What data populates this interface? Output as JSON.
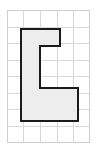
{
  "figure": {
    "canvas": {
      "width": 97,
      "height": 151,
      "background": "#ffffff"
    },
    "grid": {
      "name": "graph-paper-grid",
      "x_start": 7,
      "y_start": 10,
      "cell_size": 16.6,
      "columns": 5,
      "rows": 8,
      "line_color": "#d8d8d8",
      "line_width": 1,
      "border_color": "#cfcfcf",
      "border_width": 1,
      "visible": true
    },
    "shape": {
      "name": "c-shaped-polygon",
      "label": "C",
      "fill": "#ededed",
      "stroke": "#1a1a1a",
      "stroke_width": 2,
      "points": [
        [
          21,
          29
        ],
        [
          60,
          29
        ],
        [
          60,
          46
        ],
        [
          40,
          46
        ],
        [
          40,
          88
        ],
        [
          78,
          88
        ],
        [
          78,
          121
        ],
        [
          21,
          121
        ]
      ],
      "points_string": "21,29 60,29 60,46 40,46 40,88 78,88 78,121 21,121",
      "vertex_count": 8
    }
  }
}
